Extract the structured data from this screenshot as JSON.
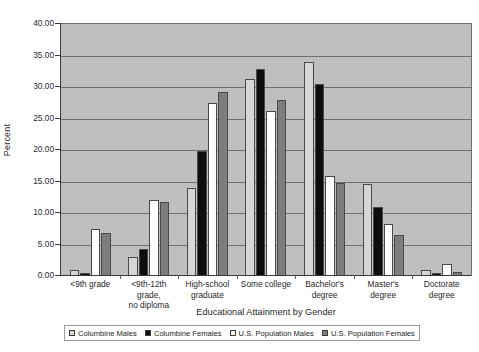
{
  "chart_data": {
    "type": "bar",
    "title": "Educational Attainment by Gender",
    "xlabel": "Educational Attainment by Gender",
    "ylabel": "Percent",
    "ylim": [
      0,
      40
    ],
    "ytick_step": 5,
    "ytick_labels": [
      "0.00",
      "5.00",
      "10.00",
      "15.00",
      "20.00",
      "25.00",
      "30.00",
      "35.00",
      "40.00"
    ],
    "ytick_values": [
      0,
      5,
      10,
      15,
      20,
      25,
      30,
      35,
      40
    ],
    "grid": true,
    "grid_axis": "y",
    "legend_position": "bottom",
    "plot_background": "#bfbfbf",
    "categories": [
      "<9th  grade",
      "<9th-12th grade,\nno diploma",
      "High-school\ngraduate",
      "Some college",
      "Bachelor's\ndegree",
      "Master's\ndegree",
      "Doctorate\ndegree"
    ],
    "series": [
      {
        "name": "Columbine Males",
        "color": "#d6d6d6",
        "values": [
          1.0,
          3.0,
          14.0,
          31.3,
          33.9,
          14.6,
          1.0
        ]
      },
      {
        "name": "Columbine Females",
        "color": "#0d0d0d",
        "values": [
          0.5,
          4.3,
          19.8,
          32.9,
          30.5,
          10.9,
          0.4
        ]
      },
      {
        "name": "U.S. Population Males",
        "color": "#ffffff",
        "values": [
          7.4,
          12.0,
          27.5,
          26.2,
          15.9,
          8.2,
          1.9
        ]
      },
      {
        "name": "U.S. Population Females",
        "color": "#7d7d7d",
        "values": [
          6.8,
          11.7,
          29.2,
          27.9,
          14.7,
          6.5,
          0.6
        ]
      }
    ]
  }
}
